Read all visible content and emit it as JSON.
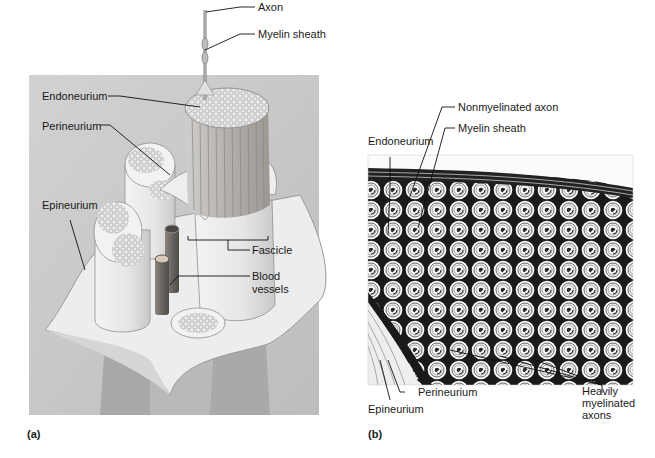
{
  "figure": {
    "panel_a": {
      "label": "(a)",
      "title": "Nerve structure illustration",
      "background_color": "#cfcfcf",
      "labels": {
        "axon": "Axon",
        "myelin_sheath": "Myelin sheath",
        "endoneurium": "Endoneurium",
        "perineurium": "Perineurium",
        "epineurium": "Epineurium",
        "fascicle": "Fascicle",
        "blood_vessels_line1": "Blood",
        "blood_vessels_line2": "vessels"
      }
    },
    "panel_b": {
      "label": "(b)",
      "title": "Nerve cross-section micrograph",
      "labels": {
        "nonmyelinated_axon": "Nonmyelinated axon",
        "myelin_sheath": "Myelin sheath",
        "endoneurium": "Endoneurium",
        "perineurium": "Perineurium",
        "epineurium": "Epineurium",
        "heavily_line1": "Heavily",
        "heavily_line2": "myelinated",
        "heavily_line3": "axons"
      }
    },
    "colors": {
      "tissue_light": "#ececec",
      "tissue_mid": "#d8d8d8",
      "vessel": "#6e6a66",
      "ink": "#111111"
    }
  }
}
